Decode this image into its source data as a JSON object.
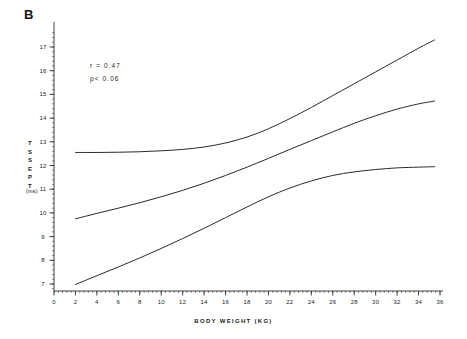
{
  "figure": {
    "panel_label": "B",
    "annotations": {
      "correlation": "r  =  0.47",
      "pvalue": "p<  0.06"
    }
  },
  "chart_data": {
    "type": "line",
    "title": "",
    "subtitle": "",
    "panel": "B",
    "xlabel": "BODY WEIGHT  (KG)",
    "ylabel": "TSSEPT",
    "ylabel_letters": [
      "T",
      "S",
      "S",
      "E",
      "P",
      "T"
    ],
    "yunit": "(ms)",
    "xlim": [
      0,
      36
    ],
    "ylim": [
      6.6,
      17.6
    ],
    "grid": false,
    "legend": "none",
    "xticks": [
      0,
      2,
      4,
      6,
      8,
      10,
      12,
      14,
      16,
      18,
      20,
      22,
      24,
      26,
      28,
      30,
      32,
      34,
      36
    ],
    "xtick_labels": [
      "0",
      "2",
      "4",
      "6",
      "8",
      "10",
      "12",
      "14",
      "16",
      "18",
      "20",
      "22",
      "24",
      "26",
      "28",
      "30",
      "32",
      "34",
      "36"
    ],
    "yticks": [
      7,
      8,
      9,
      10,
      11,
      12,
      13,
      14,
      15,
      16,
      17
    ],
    "ytick_labels": [
      "7",
      "8",
      "9",
      "10",
      "11",
      "12",
      "13",
      "14",
      "15",
      "16",
      "17"
    ],
    "annotations": [
      {
        "text": "r  =  0.47",
        "x": 12.0,
        "y": 16.0
      },
      {
        "text": "p<  0.06",
        "x": 12.0,
        "y": 15.4
      }
    ],
    "series": [
      {
        "name": "upper-band",
        "role": "upper confidence band",
        "x": [
          2.0,
          4.0,
          6.0,
          8.0,
          10.0,
          12.0,
          14.0,
          16.0,
          18.0,
          20.0,
          22.0,
          24.0,
          26.0,
          28.0,
          30.0,
          32.0,
          34.0,
          35.5
        ],
        "y": [
          12.55,
          12.55,
          12.56,
          12.58,
          12.62,
          12.68,
          12.78,
          12.95,
          13.2,
          13.55,
          13.98,
          14.45,
          14.95,
          15.45,
          15.95,
          16.45,
          16.95,
          17.3
        ]
      },
      {
        "name": "regression-line",
        "role": "fitted regression line",
        "x": [
          2.0,
          4.0,
          6.0,
          8.0,
          10.0,
          12.0,
          14.0,
          16.0,
          18.0,
          20.0,
          22.0,
          24.0,
          26.0,
          28.0,
          30.0,
          32.0,
          34.0,
          35.5
        ],
        "y": [
          9.75,
          9.98,
          10.2,
          10.43,
          10.68,
          10.95,
          11.25,
          11.58,
          11.93,
          12.3,
          12.68,
          13.05,
          13.42,
          13.78,
          14.1,
          14.38,
          14.6,
          14.72
        ]
      },
      {
        "name": "lower-band",
        "role": "lower confidence band",
        "x": [
          2.0,
          4.0,
          6.0,
          8.0,
          10.0,
          12.0,
          14.0,
          16.0,
          18.0,
          20.0,
          22.0,
          24.0,
          26.0,
          28.0,
          30.0,
          32.0,
          34.0,
          35.5
        ],
        "y": [
          6.98,
          7.35,
          7.72,
          8.1,
          8.5,
          8.92,
          9.35,
          9.8,
          10.25,
          10.68,
          11.05,
          11.35,
          11.58,
          11.73,
          11.83,
          11.9,
          11.93,
          11.95
        ]
      }
    ]
  }
}
